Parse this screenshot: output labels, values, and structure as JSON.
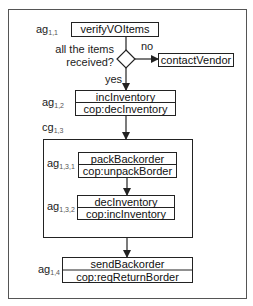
{
  "diagram": {
    "type": "activity-flow",
    "outer_frame": true,
    "decision": {
      "question_line1": "all the items",
      "question_line2": "received?",
      "no_label": "no",
      "yes_label": "yes"
    },
    "nodes": {
      "verify": {
        "tag": "ag",
        "sub": "1,1",
        "title": "verifyVOItems"
      },
      "contact": {
        "title": "contactVendor"
      },
      "inc": {
        "tag": "ag",
        "sub": "1,2",
        "title": "incInventory",
        "cop": "cop:decInventory"
      },
      "group": {
        "tag": "cg",
        "sub": "1,3"
      },
      "pack": {
        "tag": "ag",
        "sub": "1,3,1",
        "title": "packBackorder",
        "cop": "cop:unpackBorder"
      },
      "dec": {
        "tag": "ag",
        "sub": "1,3,2",
        "title": "decInventory",
        "cop": "cop:incInventory"
      },
      "send": {
        "tag": "ag",
        "sub": "1,4",
        "title": "sendBackorder",
        "cop": "cop:reqReturnBorder"
      }
    },
    "colors": {
      "line": "#222222",
      "frame": "#555555",
      "text": "#111111",
      "subscript": "#555555"
    }
  }
}
